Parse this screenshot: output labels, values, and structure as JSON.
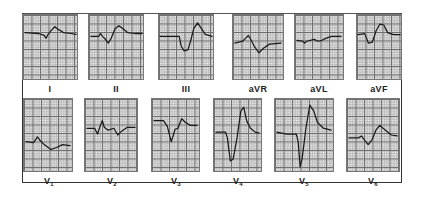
{
  "figure": {
    "title": "",
    "rows": [
      {
        "leads": [
          {
            "id": "I",
            "label": "I"
          },
          {
            "id": "II",
            "label": "II"
          },
          {
            "id": "III",
            "label": "III"
          },
          {
            "id": "aVR",
            "label": "aVR"
          },
          {
            "id": "aVL",
            "label": "aVL"
          },
          {
            "id": "aVF",
            "label": "aVF"
          }
        ]
      },
      {
        "leads": [
          {
            "id": "V1",
            "label": "V",
            "sub": "1"
          },
          {
            "id": "V2",
            "label": "V",
            "sub": "2"
          },
          {
            "id": "V3",
            "label": "V",
            "sub": "3"
          },
          {
            "id": "V4",
            "label": "V",
            "sub": "4"
          },
          {
            "id": "V5",
            "label": "V",
            "sub": "5"
          },
          {
            "id": "V6",
            "label": "V",
            "sub": "6"
          }
        ]
      }
    ],
    "colors": {
      "trace": "#1a1a1a",
      "grid_major": "#6e6e6e",
      "grid_minor": "#bdbdbd",
      "paper": "#f4f4f4",
      "frame": "#333333"
    }
  }
}
